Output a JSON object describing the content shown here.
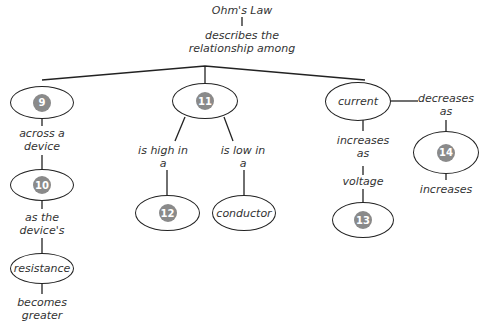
{
  "title": "Ohm's Law",
  "root_link": "describes the relationship among",
  "nodes": {
    "n9": "9",
    "n10": "10",
    "n11": "11",
    "n12": "12",
    "n13": "13",
    "n14": "14",
    "current": "current",
    "conductor": "conductor",
    "resistance": "resistance",
    "voltage": "voltage"
  },
  "links": {
    "across": "across a device",
    "as_the": "as the device's",
    "becomes": "becomes greater",
    "is_high": "is high in a",
    "is_low": "is low in a",
    "increases_as": "increases as",
    "decreases_as": "decreases as",
    "increases": "increases"
  },
  "colors": {
    "badge": "#8a8a8a",
    "line": "#222222",
    "text": "#333333"
  }
}
